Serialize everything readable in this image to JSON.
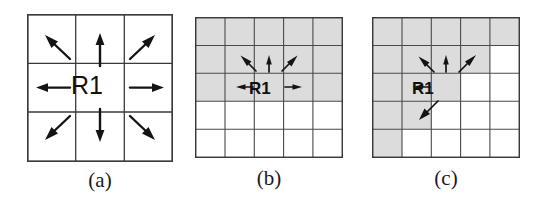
{
  "figure": {
    "background_color": "#ffffff",
    "line_color": "#3a3a3a",
    "border_color": "#3a3a3a",
    "shade_color": "#dcdcdc",
    "arrow_color": "#141414",
    "label_color": "#111111"
  },
  "panels": [
    {
      "id": "a",
      "caption": "(a)",
      "region_label": "R1",
      "grid": {
        "cols": 3,
        "rows": 3,
        "cell": 48.7,
        "width": 146,
        "height": 148
      },
      "shaded_cells": [],
      "center_cell": {
        "col": 2,
        "row": 2
      },
      "arrows": [
        {
          "name": "arrow-north",
          "dir": "N"
        },
        {
          "name": "arrow-northeast",
          "dir": "NE"
        },
        {
          "name": "arrow-east",
          "dir": "E"
        },
        {
          "name": "arrow-southeast",
          "dir": "SE"
        },
        {
          "name": "arrow-south",
          "dir": "S"
        },
        {
          "name": "arrow-southwest",
          "dir": "SW"
        },
        {
          "name": "arrow-west",
          "dir": "W"
        },
        {
          "name": "arrow-northwest",
          "dir": "NW"
        }
      ],
      "arrow_count": 8
    },
    {
      "id": "b",
      "caption": "(b)",
      "region_label": "R1",
      "grid": {
        "cols": 5,
        "rows": 5,
        "cell": 29.6,
        "width": 148,
        "height": 141
      },
      "shaded_cells": [
        [
          1,
          1
        ],
        [
          1,
          2
        ],
        [
          1,
          3
        ],
        [
          1,
          4
        ],
        [
          1,
          5
        ],
        [
          2,
          1
        ],
        [
          2,
          2
        ],
        [
          2,
          3
        ],
        [
          2,
          4
        ],
        [
          2,
          5
        ],
        [
          3,
          1
        ],
        [
          3,
          2
        ],
        [
          3,
          3
        ],
        [
          3,
          4
        ],
        [
          3,
          5
        ]
      ],
      "center_cell": {
        "col": 3,
        "row": 3
      },
      "arrows": [
        {
          "name": "arrow-northwest",
          "dir": "NW"
        },
        {
          "name": "arrow-north",
          "dir": "N"
        },
        {
          "name": "arrow-northeast",
          "dir": "NE"
        },
        {
          "name": "arrow-west",
          "dir": "W"
        },
        {
          "name": "arrow-east",
          "dir": "E"
        }
      ],
      "arrow_count": 5
    },
    {
      "id": "c",
      "caption": "(c)",
      "region_label": "R1",
      "grid": {
        "cols": 5,
        "rows": 5,
        "cell": 29.6,
        "width": 148,
        "height": 141
      },
      "shaded_cells": [
        [
          1,
          1
        ],
        [
          1,
          2
        ],
        [
          1,
          3
        ],
        [
          1,
          4
        ],
        [
          1,
          5
        ],
        [
          2,
          1
        ],
        [
          2,
          2
        ],
        [
          2,
          3
        ],
        [
          2,
          4
        ],
        [
          3,
          1
        ],
        [
          3,
          2
        ],
        [
          3,
          3
        ],
        [
          4,
          1
        ],
        [
          4,
          2
        ],
        [
          5,
          1
        ]
      ],
      "center_cell": {
        "col": 3,
        "row": 3
      },
      "arrows": [
        {
          "name": "arrow-northwest",
          "dir": "NW"
        },
        {
          "name": "arrow-north",
          "dir": "N"
        },
        {
          "name": "arrow-northeast",
          "dir": "NE"
        },
        {
          "name": "arrow-west",
          "dir": "W"
        },
        {
          "name": "arrow-southwest",
          "dir": "SW"
        }
      ],
      "arrow_count": 5
    }
  ]
}
